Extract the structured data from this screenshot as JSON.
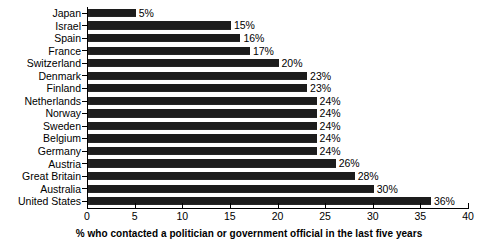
{
  "chart_data": {
    "type": "bar",
    "orientation": "horizontal",
    "title": "",
    "xlabel": "% who contacted a politician or government official in the last five years",
    "ylabel": "",
    "xlim": [
      0,
      40
    ],
    "xticks": [
      0,
      5,
      10,
      15,
      20,
      25,
      30,
      35,
      40
    ],
    "xtick_labels": [
      "0",
      "5",
      "10",
      "15",
      "20",
      "25",
      "30",
      "35",
      "40"
    ],
    "grid": false,
    "legend": false,
    "bar_color": "#1c1c1c",
    "categories": [
      "Japan",
      "Israel",
      "Spain",
      "France",
      "Switzerland",
      "Denmark",
      "Finland",
      "Netherlands",
      "Norway",
      "Sweden",
      "Belgium",
      "Germany",
      "Austria",
      "Great Britain",
      "Australia",
      "United States"
    ],
    "values": [
      5,
      15,
      16,
      17,
      20,
      23,
      23,
      24,
      24,
      24,
      24,
      24,
      26,
      28,
      30,
      36
    ],
    "value_labels": [
      "5%",
      "15%",
      "16%",
      "17%",
      "20%",
      "23%",
      "23%",
      "24%",
      "24%",
      "24%",
      "24%",
      "24%",
      "26%",
      "28%",
      "30%",
      "36%"
    ]
  }
}
